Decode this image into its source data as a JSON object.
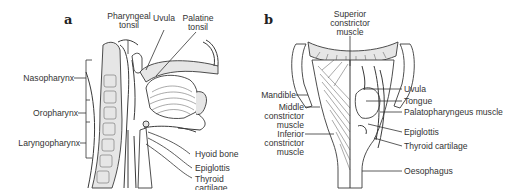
{
  "figure": {
    "panels": [
      {
        "letter": "a",
        "view": "sagittal section of head and neck",
        "labels": {
          "pharyngeal_tonsil_1": "Pharyngeal",
          "pharyngeal_tonsil_2": "tonsil",
          "uvula": "Uvula",
          "palatine_tonsil_1": "Palatine",
          "palatine_tonsil_2": "tonsil",
          "nasopharynx": "Nasopharynx",
          "oropharynx": "Oropharynx",
          "laryngopharynx": "Laryngopharynx",
          "hyoid_bone": "Hyoid bone",
          "epiglottis": "Epiglottis",
          "thyroid_cartilage_1": "Thyroid",
          "thyroid_cartilage_2": "cartilage"
        }
      },
      {
        "letter": "b",
        "view": "posterior view of pharynx",
        "labels": {
          "superior_constrictor_1": "Superior",
          "superior_constrictor_2": "constrictor",
          "superior_constrictor_3": "muscle",
          "mandible": "Mandible",
          "middle_constrictor_1": "Middle",
          "middle_constrictor_2": "constrictor",
          "middle_constrictor_3": "muscle",
          "inferior_constrictor_1": "Inferior",
          "inferior_constrictor_2": "constrictor",
          "inferior_constrictor_3": "muscle",
          "uvula": "Uvula",
          "tongue": "Tongue",
          "palatopharyngeus": "Palatopharyngeus muscle",
          "epiglottis": "Epiglottis",
          "thyroid_cartilage": "Thyroid cartilage",
          "oesophagus": "Oesophagus"
        }
      }
    ]
  }
}
